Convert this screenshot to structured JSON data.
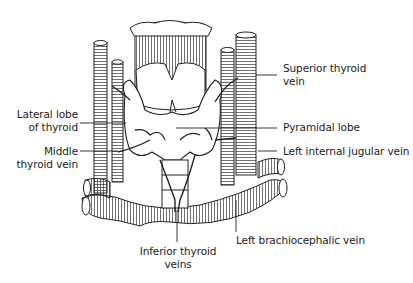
{
  "diagram": {
    "labels": {
      "lateral_lobe": [
        "Lateral lobe",
        "of thyroid"
      ],
      "middle_thyroid_vein": [
        "Middle",
        "thyroid vein"
      ],
      "superior_thyroid_vein": [
        "Superior thyroid",
        "vein"
      ],
      "pyramidal_lobe": "Pyramidal lobe",
      "left_internal_jugular_vein": "Left internal jugular vein",
      "left_brachiocephalic_vein": "Left brachiocephalic vein",
      "inferior_thyroid_veins": [
        "Inferior thyroid",
        "veins"
      ]
    },
    "colors": {
      "ink": "#222222",
      "background": "#ffffff"
    }
  }
}
